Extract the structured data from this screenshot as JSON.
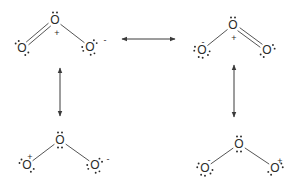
{
  "diagram": {
    "colors": {
      "ink": "#2a2a2a",
      "bond": "#555555",
      "arrow": "#3a3a3a",
      "background": "#ffffff"
    },
    "structures": [
      {
        "name": "resonance-structure-top-left",
        "atoms": [
          {
            "symbol": "O",
            "x": 55,
            "y": 20,
            "charge": "+",
            "charge_x": 57,
            "charge_y": 33,
            "lone_pairs": [
              -90
            ]
          },
          {
            "symbol": "O",
            "x": 22,
            "y": 48,
            "charge": "",
            "lone_pairs": [
              -130,
              50
            ]
          },
          {
            "symbol": "O",
            "x": 90,
            "y": 47,
            "charge": "-",
            "charge_x": 105,
            "charge_y": 40,
            "lone_pairs": [
              -45,
              70,
              165
            ]
          }
        ],
        "bonds": [
          {
            "from": 0,
            "to": 1,
            "order": 2
          },
          {
            "from": 0,
            "to": 2,
            "order": 1
          }
        ]
      },
      {
        "name": "resonance-structure-top-right",
        "atoms": [
          {
            "symbol": "O",
            "x": 233,
            "y": 25,
            "charge": "+",
            "charge_x": 234,
            "charge_y": 38,
            "lone_pairs": [
              -90
            ]
          },
          {
            "symbol": "O",
            "x": 202,
            "y": 50,
            "charge": "-",
            "charge_x": 203,
            "charge_y": 42,
            "lone_pairs": [
              190,
              100,
              25
            ]
          },
          {
            "symbol": "O",
            "x": 267,
            "y": 50,
            "charge": "",
            "lone_pairs": [
              -25,
              130
            ]
          }
        ],
        "bonds": [
          {
            "from": 0,
            "to": 1,
            "order": 1
          },
          {
            "from": 0,
            "to": 2,
            "order": 2
          }
        ]
      },
      {
        "name": "resonance-structure-bottom-left",
        "atoms": [
          {
            "symbol": "O",
            "x": 60,
            "y": 140,
            "charge": "",
            "lone_pairs": [
              -90,
              90
            ]
          },
          {
            "symbol": "O",
            "x": 27,
            "y": 165,
            "charge": "+",
            "charge_x": 30,
            "charge_y": 157,
            "lone_pairs": [
              -150,
              45
            ]
          },
          {
            "symbol": "O",
            "x": 95,
            "y": 165,
            "charge": "-",
            "charge_x": 108,
            "charge_y": 159,
            "lone_pairs": [
              -40,
              70,
              165
            ]
          }
        ],
        "bonds": [
          {
            "from": 0,
            "to": 1,
            "order": 1
          },
          {
            "from": 0,
            "to": 2,
            "order": 1
          }
        ]
      },
      {
        "name": "resonance-structure-bottom-right",
        "atoms": [
          {
            "symbol": "O",
            "x": 239,
            "y": 144,
            "charge": "",
            "lone_pairs": [
              -90,
              90
            ]
          },
          {
            "symbol": "O",
            "x": 205,
            "y": 168,
            "charge": "-",
            "charge_x": 209,
            "charge_y": 160,
            "lone_pairs": [
              200,
              105,
              30
            ]
          },
          {
            "symbol": "O",
            "x": 275,
            "y": 168,
            "charge": "+",
            "charge_x": 280,
            "charge_y": 161,
            "lone_pairs": [
              -20,
              135
            ]
          }
        ],
        "bonds": [
          {
            "from": 0,
            "to": 1,
            "order": 1
          },
          {
            "from": 0,
            "to": 2,
            "order": 1
          }
        ]
      }
    ],
    "arrows": [
      {
        "name": "resonance-arrow-horizontal",
        "x1": 122,
        "y1": 39,
        "x2": 175,
        "y2": 39
      },
      {
        "name": "resonance-arrow-left-vertical",
        "x1": 60,
        "y1": 68,
        "x2": 60,
        "y2": 116
      },
      {
        "name": "resonance-arrow-right-vertical",
        "x1": 234,
        "y1": 65,
        "x2": 234,
        "y2": 117
      }
    ]
  }
}
